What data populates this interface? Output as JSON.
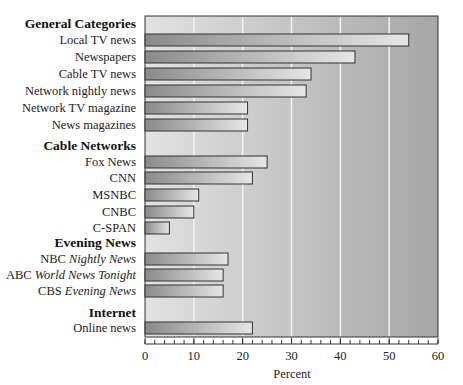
{
  "chart_data": {
    "type": "bar",
    "orientation": "horizontal",
    "title": "",
    "xlabel": "Percent",
    "ylabel": "",
    "xlim": [
      0,
      60
    ],
    "xticks": [
      0,
      10,
      20,
      30,
      40,
      50,
      60
    ],
    "grid": true,
    "legend": null,
    "groups": [
      {
        "name": "General Categories",
        "categories": [
          "Local TV news",
          "Newspapers",
          "Cable TV news",
          "Network nightly news",
          "Network TV magazine",
          "News magazines"
        ],
        "values": [
          54,
          43,
          34,
          33,
          21,
          21
        ]
      },
      {
        "name": "Cable Networks",
        "categories": [
          "Fox News",
          "CNN",
          "MSNBC",
          "CNBC",
          "C-SPAN"
        ],
        "values": [
          25,
          22,
          11,
          10,
          5
        ]
      },
      {
        "name": "Evening News",
        "categories": [
          "NBC Nightly News",
          "ABC World News Tonight",
          "CBS Evening News"
        ],
        "values": [
          17,
          16,
          16
        ]
      },
      {
        "name": "Internet",
        "categories": [
          "Online news"
        ],
        "values": [
          22
        ]
      }
    ]
  },
  "rows": [
    {
      "kind": "header",
      "label": "General Categories",
      "y": 23
    },
    {
      "kind": "bar",
      "label": "Local TV news",
      "value": 54,
      "y": 40
    },
    {
      "kind": "bar",
      "label": "Newspapers",
      "value": 43,
      "y": 57
    },
    {
      "kind": "bar",
      "label": "Cable TV news",
      "value": 34,
      "y": 74
    },
    {
      "kind": "bar",
      "label": "Network nightly news",
      "value": 33,
      "y": 91
    },
    {
      "kind": "bar",
      "label": "Network TV magazine",
      "value": 21,
      "y": 108
    },
    {
      "kind": "bar",
      "label": "News magazines",
      "value": 21,
      "y": 125
    },
    {
      "kind": "header",
      "label": "Cable Networks",
      "y": 145
    },
    {
      "kind": "bar",
      "label": "Fox News",
      "value": 25,
      "y": 162
    },
    {
      "kind": "bar",
      "label": "CNN",
      "value": 22,
      "y": 178
    },
    {
      "kind": "bar",
      "label": "MSNBC",
      "value": 11,
      "y": 195
    },
    {
      "kind": "bar",
      "label": "CNBC",
      "value": 10,
      "y": 212
    },
    {
      "kind": "bar",
      "label": "C-SPAN",
      "value": 5,
      "y": 228
    },
    {
      "kind": "header",
      "label": "Evening News",
      "y": 242
    },
    {
      "kind": "bar",
      "label": "NBC ",
      "italic": "Nightly News",
      "value": 17,
      "y": 259
    },
    {
      "kind": "bar",
      "label": "ABC ",
      "italic": "World News Tonight",
      "value": 16,
      "y": 275
    },
    {
      "kind": "bar",
      "label": "CBS ",
      "italic": "Evening News",
      "value": 16,
      "y": 291
    },
    {
      "kind": "header",
      "label": "Internet",
      "y": 312
    },
    {
      "kind": "bar",
      "label": "Online news",
      "value": 22,
      "y": 328
    }
  ],
  "axis": {
    "xlabel": "Percent",
    "ticks": [
      "0",
      "10",
      "20",
      "30",
      "40",
      "50",
      "60"
    ]
  },
  "colors": {
    "plot_bg_left": "#e2e2e2",
    "plot_bg_right": "#a8a8a8",
    "bar_left": "#8e8e8e",
    "bar_right": "#e4e4e4",
    "bar_stroke": "#333333",
    "grid": "#f4f4f4"
  }
}
